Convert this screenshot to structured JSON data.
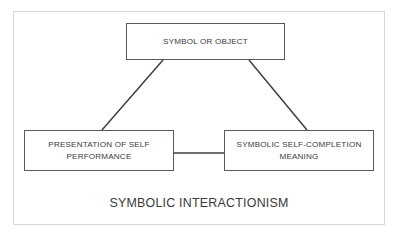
{
  "diagram": {
    "title": "SYMBOLIC INTERACTIONISM",
    "nodes": [
      {
        "id": "symbol-or-object",
        "label": "SYMBOL OR OBJECT"
      },
      {
        "id": "presentation-of-self",
        "label": "PRESENTATION OF SELF\nPERFORMANCE"
      },
      {
        "id": "symbolic-self-completion",
        "label": "SYMBOLIC SELF-COMPLETION\nMEANING"
      }
    ],
    "connectors": [
      {
        "id": "symbol-to-presentation",
        "from": "symbol-or-object",
        "to": "presentation-of-self",
        "style": "diagonal-line"
      },
      {
        "id": "symbol-to-self-completion",
        "from": "symbol-or-object",
        "to": "symbolic-self-completion",
        "style": "diagonal-line"
      },
      {
        "id": "presentation-to-self-completion",
        "from": "presentation-of-self",
        "to": "symbolic-self-completion",
        "style": "horizontal-line"
      }
    ],
    "colors": {
      "background": "#ffffff",
      "frame_border": "#d8d8da",
      "node_border": "#59595c",
      "connector": "#3f3f42",
      "text": "#3a3a3d"
    }
  }
}
